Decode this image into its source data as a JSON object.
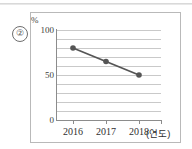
{
  "figure": {
    "item_number": "②",
    "axis_unit_label": "%",
    "xaxis_title": "(연도)"
  },
  "chart_data": {
    "type": "line",
    "title": "",
    "subtitle": "",
    "xlabel": "(연도)",
    "ylabel": "%",
    "categories": [
      "2016",
      "2017",
      "2018"
    ],
    "values": [
      80,
      65,
      50
    ],
    "ylim": [
      0,
      100
    ],
    "yticks": [
      0,
      50,
      100
    ],
    "ytick_labels": [
      "0",
      "50",
      "100"
    ],
    "gridlines_every": 10,
    "grid": true,
    "legend": false,
    "legend_position": "none",
    "series": [
      {
        "name": "",
        "values": [
          80,
          65,
          50
        ],
        "color": "#555555",
        "marker": "circle"
      }
    ],
    "annotations": []
  }
}
